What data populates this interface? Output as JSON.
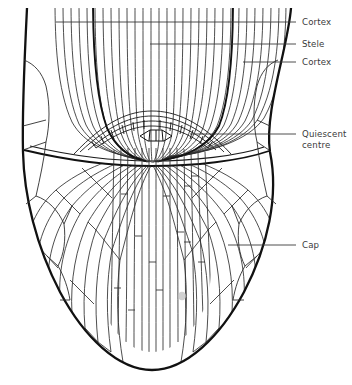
{
  "figure": {
    "kind": "root-tip-longitudinal-section-line-drawing",
    "background_color": "#ffffff",
    "ink_color": "#1a1a1a",
    "cell_line_color": "#2b2b2b",
    "label_color": "#3a3a3a",
    "leader_color": "#3a3a3a",
    "smudge_color": "#b9b9b9"
  },
  "labels": [
    {
      "id": "cortex-upper",
      "text": "Cortex",
      "x": 302,
      "y": 17,
      "leader_from_x": 296,
      "leader_to_x": 56,
      "leader_y": 22
    },
    {
      "id": "stele",
      "text": "Stele",
      "x": 302,
      "y": 39,
      "leader_from_x": 296,
      "leader_to_x": 150,
      "leader_y": 44
    },
    {
      "id": "cortex-lower",
      "text": "Cortex",
      "x": 302,
      "y": 57,
      "leader_from_x": 296,
      "leader_to_x": 243,
      "leader_y": 62
    },
    {
      "id": "quiescent-centre",
      "text": "Quiescent\ncentre",
      "x": 302,
      "y": 129,
      "leader_from_x": 296,
      "leader_to_x": 190,
      "leader_y": 134
    },
    {
      "id": "cap",
      "text": "Cap",
      "x": 302,
      "y": 240,
      "leader_from_x": 296,
      "leader_to_x": 228,
      "leader_y": 245
    }
  ],
  "anatomy": {
    "outline_top_left_x": 27,
    "outline_top_right_x": 291,
    "widest_left_x": 22,
    "widest_right_x": 270,
    "widest_y": 160,
    "tip_y": 370,
    "tip_center_x": 152,
    "meristem_boundary_y": 145,
    "quiescent_centre_x": 165,
    "quiescent_centre_y": 133,
    "smudge_x": 182,
    "smudge_y": 296
  }
}
